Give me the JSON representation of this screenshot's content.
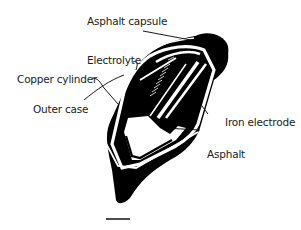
{
  "diagram": {
    "labels": {
      "asphalt_capsule": "Asphalt capsule",
      "electrolyte": "Electrolyte",
      "copper_cylinder": "Copper cylinder",
      "outer_case": "Outer case",
      "iron_electrode": "Iron electrode",
      "asphalt": "Asphalt"
    },
    "colors": {
      "ink": "#000000",
      "text": "#222222",
      "background": "#ffffff"
    },
    "scale_bar": true
  }
}
